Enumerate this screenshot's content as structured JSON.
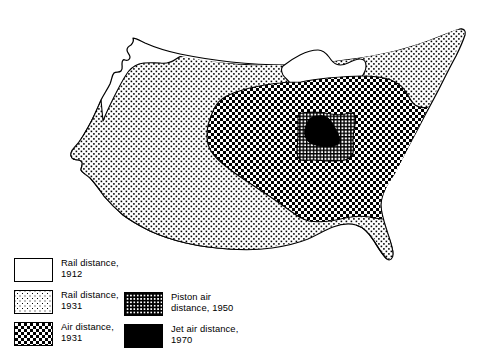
{
  "figure": {
    "map_name": "contiguous-united-states"
  },
  "legend": {
    "columns": [
      {
        "name": "legend-column-left",
        "entries": [
          {
            "id": "rail-1912",
            "pattern": "blank",
            "label": "Rail distance,\n1912"
          },
          {
            "id": "rail-1931",
            "pattern": "dots",
            "label": "Rail distance,\n1931"
          },
          {
            "id": "air-1931",
            "pattern": "checker",
            "label": "Air distance,\n1931"
          }
        ]
      },
      {
        "name": "legend-column-right",
        "entries": [
          {
            "id": "piston-1950",
            "pattern": "grid",
            "label": "Piston air\ndistance, 1950"
          },
          {
            "id": "jet-1970",
            "pattern": "solid",
            "label": "Jet air distance,\n1970"
          }
        ]
      }
    ]
  },
  "regions": [
    {
      "id": "rail-1912",
      "name": "region-rail-distance-1912",
      "fill": "blank",
      "description": "Entire contiguous United States outline"
    },
    {
      "id": "rail-1931",
      "name": "region-rail-distance-1931",
      "fill": "dots",
      "description": "Stippled area covering the Rockies eastward to the Atlantic"
    },
    {
      "id": "air-1931",
      "name": "region-air-distance-1931",
      "fill": "checker",
      "description": "Checkered area over the Great Plains and Midwest"
    },
    {
      "id": "piston-1950",
      "name": "region-piston-air-distance-1950",
      "fill": "grid",
      "description": "Fine cross-hatched area over the central Midwest"
    },
    {
      "id": "jet-1970",
      "name": "region-jet-air-distance-1970",
      "fill": "solid",
      "description": "Solid black area near central Illinois / Indiana"
    }
  ],
  "colors": {
    "ink": "#000000",
    "paper": "#ffffff"
  }
}
